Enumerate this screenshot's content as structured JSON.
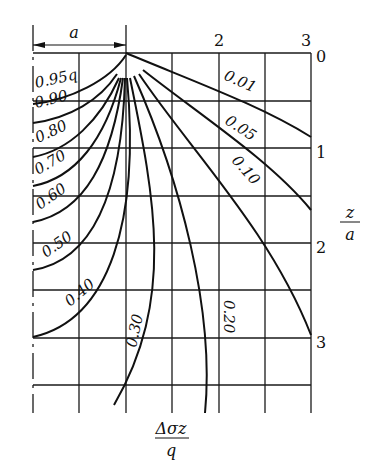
{
  "diagram": {
    "title": "",
    "dimension_label": "a",
    "x_ticks": [
      {
        "label": "2",
        "x": 219
      },
      {
        "label": "3",
        "x": 311
      }
    ],
    "y_ticks": [
      {
        "label": "0",
        "y": 53
      },
      {
        "label": "1",
        "y": 148
      },
      {
        "label": "2",
        "y": 243
      },
      {
        "label": "3",
        "y": 338
      }
    ],
    "x_axis_label": {
      "numerator": "Δσz",
      "denominator": "q"
    },
    "y_axis_label": {
      "numerator": "z",
      "denominator": "a"
    },
    "contours": [
      {
        "value": "0.95q",
        "label": "0.95q"
      },
      {
        "value": "0.90",
        "label": "0.90"
      },
      {
        "value": "0.80",
        "label": "0.80"
      },
      {
        "value": "0.70",
        "label": "0.70"
      },
      {
        "value": "0.60",
        "label": "0.60"
      },
      {
        "value": "0.50",
        "label": "0.50"
      },
      {
        "value": "0.40",
        "label": "0.40"
      },
      {
        "value": "0.30",
        "label": "0.30"
      },
      {
        "value": "0.20",
        "label": "0.20"
      },
      {
        "value": "0.10",
        "label": "0.10"
      },
      {
        "value": "0.05",
        "label": "0.05"
      },
      {
        "value": "0.01",
        "label": "0.01"
      }
    ]
  }
}
